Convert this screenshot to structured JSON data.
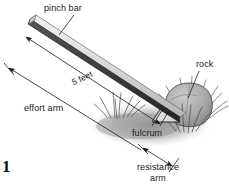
{
  "figure": {
    "folio": "1",
    "background_color": "#ffffff",
    "ink_color": "#1a1a1a"
  },
  "labels": {
    "pinch_bar": "pinch bar",
    "rock": "rock",
    "effort_arm": "effort arm",
    "five_feet": "5 feet",
    "fulcrum": "fulcrum",
    "resistance_arm_line1": "resistance",
    "resistance_arm_line2": "arm"
  },
  "measurements": {
    "bar_length": "5 feet"
  },
  "colors": {
    "bar_top": "#e8e8e8",
    "bar_bottom": "#3a3a3a",
    "rock_fill": "#a8a8a8",
    "ground_shadow": "#9a9a9a",
    "grass": "#707070",
    "fulcrum_fill": "#d8d8d8"
  },
  "parts": [
    {
      "name": "pinch-bar",
      "label": "pinch bar"
    },
    {
      "name": "rock",
      "label": "rock"
    },
    {
      "name": "fulcrum",
      "label": "fulcrum"
    },
    {
      "name": "effort-arm",
      "label": "effort arm"
    },
    {
      "name": "resistance-arm",
      "label": "resistance arm"
    }
  ]
}
